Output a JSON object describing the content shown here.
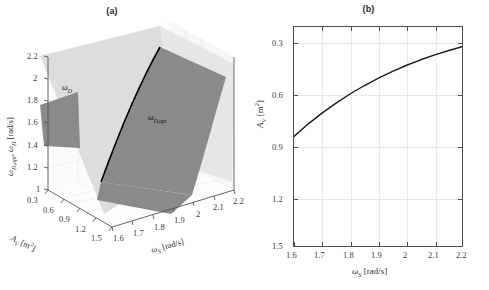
{
  "figure": {
    "panels": [
      {
        "id": "a",
        "title": "(a)",
        "type": "3d-surface",
        "axes": {
          "x": {
            "label": "A_V [m^2]",
            "ticks": [
              "0.3",
              "0.6",
              "0.9",
              "1.2",
              "1.5"
            ],
            "range": [
              0.3,
              1.5
            ]
          },
          "y": {
            "label": "ω_S [rad/s]",
            "ticks": [
              "1.6",
              "1.7",
              "1.8",
              "1.9",
              "2",
              "2.1",
              "2.2"
            ],
            "range": [
              1.6,
              2.2
            ]
          },
          "z": {
            "label": "ω_D,opt , ω_D [rad/s]",
            "ticks": [
              "1",
              "1.2",
              "1.4",
              "1.6",
              "1.8",
              "2",
              "2.2"
            ],
            "range": [
              1.0,
              2.2
            ]
          }
        },
        "surfaces": [
          {
            "name": "omega-D-surface",
            "label": "ω_D",
            "color": "#dcdcdc"
          },
          {
            "name": "omega-D-opt-surface",
            "label": "ω_D,opt",
            "color": "#8a8a8a"
          }
        ],
        "intersection_curve": {
          "name": "surface-intersection",
          "color": "#000000"
        }
      },
      {
        "id": "b",
        "title": "(b)",
        "type": "line",
        "axes": {
          "x": {
            "label": "ω_S [rad/s]",
            "ticks": [
              "1.6",
              "1.7",
              "1.8",
              "1.9",
              "2",
              "2.1",
              "2.2"
            ],
            "range": [
              1.6,
              2.2
            ]
          },
          "y": {
            "label": "A_V [m^2]",
            "ticks": [
              "0.3",
              "0.6",
              "0.9",
              "1.2",
              "1.5"
            ],
            "range": [
              0.3,
              1.5
            ],
            "reversed": true
          }
        }
      }
    ]
  },
  "chart_data": [
    {
      "type": "line",
      "title": "(b)",
      "xlabel": "ω_S [rad/s]",
      "ylabel": "A_V [m²]",
      "xlim": [
        1.6,
        2.2
      ],
      "ylim": [
        1.5,
        0.3
      ],
      "y_inverted": true,
      "grid": true,
      "legend": "none",
      "xticks": [
        1.6,
        1.7,
        1.8,
        1.9,
        2.0,
        2.1,
        2.2
      ],
      "yticks": [
        0.3,
        0.6,
        0.9,
        1.2,
        1.5
      ],
      "series": [
        {
          "name": "A_V optimal",
          "color": "#1a1a1a",
          "x": [
            1.6,
            1.65,
            1.7,
            1.75,
            1.8,
            1.85,
            1.9,
            1.95,
            2.0,
            2.05,
            2.1,
            2.15,
            2.2
          ],
          "y": [
            0.9,
            0.832,
            0.772,
            0.717,
            0.667,
            0.622,
            0.581,
            0.544,
            0.511,
            0.481,
            0.454,
            0.43,
            0.408
          ]
        }
      ]
    },
    {
      "type": "surface",
      "title": "(a)",
      "xlabel": "A_V [m²]",
      "ylabel": "ω_S [rad/s]",
      "zlabel": "ω_D,opt , ω_D [rad/s]",
      "xlim": [
        0.3,
        1.5
      ],
      "ylim": [
        1.6,
        2.2
      ],
      "zlim": [
        1.0,
        2.2
      ],
      "xticks": [
        0.3,
        0.6,
        0.9,
        1.2,
        1.5
      ],
      "yticks": [
        1.6,
        1.7,
        1.8,
        1.9,
        2.0,
        2.1,
        2.2
      ],
      "zticks": [
        1.0,
        1.2,
        1.4,
        1.6,
        1.8,
        2.0,
        2.2
      ],
      "surfaces": [
        {
          "name": "ω_D",
          "color": "#dcdcdc",
          "description": "light near-white plane, rises with ω_S"
        },
        {
          "name": "ω_D,opt",
          "color": "#8a8a8a",
          "description": "mid-gray plane, tilted, crosses the ω_D plane"
        }
      ],
      "annotations": [
        {
          "text": "ω_D",
          "x": 0.55,
          "y": 1.72,
          "z": 1.95
        },
        {
          "text": "ω_D,opt",
          "x": 1.0,
          "y": 2.0,
          "z": 1.62
        }
      ]
    }
  ]
}
